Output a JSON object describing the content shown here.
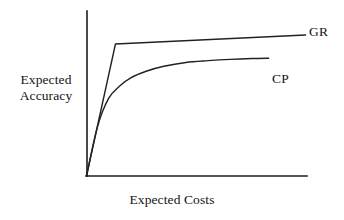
{
  "chart_data": {
    "type": "line",
    "title": "",
    "subtitle": "",
    "xlabel": "Expected Costs",
    "ylabel_lines": [
      "Expected",
      "Accuracy"
    ],
    "ylabel": "Expected Accuracy",
    "xlim": [
      0,
      100
    ],
    "ylim": [
      0,
      100
    ],
    "grid": false,
    "axis_ticks": false,
    "tick_labels": {
      "x": [],
      "y": []
    },
    "legend_position": "inline-right-of-curve",
    "annotations": [
      {
        "text": "GR",
        "x": 101,
        "y": 91,
        "series": "GR"
      },
      {
        "text": "CP",
        "x": 85,
        "y": 62,
        "series": "CP"
      }
    ],
    "series": [
      {
        "name": "GR",
        "label": "GR",
        "shape": "piecewise-linear",
        "color": "#222222",
        "points": [
          {
            "x": 0,
            "y": 0
          },
          {
            "x": 13.1,
            "y": 80.0
          },
          {
            "x": 99.1,
            "y": 85.5
          }
        ]
      },
      {
        "name": "CP",
        "label": "CP",
        "shape": "concave-saturating",
        "color": "#222222",
        "points": [
          {
            "x": 0,
            "y": 0
          },
          {
            "x": 5.0,
            "y": 30.0
          },
          {
            "x": 10.0,
            "y": 47.0
          },
          {
            "x": 15.0,
            "y": 54.5
          },
          {
            "x": 20.0,
            "y": 59.5
          },
          {
            "x": 27.0,
            "y": 63.5
          },
          {
            "x": 35.0,
            "y": 66.5
          },
          {
            "x": 45.0,
            "y": 68.8
          },
          {
            "x": 55.0,
            "y": 69.9
          },
          {
            "x": 65.0,
            "y": 70.7
          },
          {
            "x": 75.0,
            "y": 71.2
          },
          {
            "x": 82.4,
            "y": 71.4
          }
        ]
      }
    ]
  },
  "axes": {
    "y_axis_name": "y-axis",
    "x_axis_name": "x-axis"
  },
  "colors": {
    "background": "#ffffff",
    "ink": "#1c1c1c",
    "series": "#222222"
  }
}
